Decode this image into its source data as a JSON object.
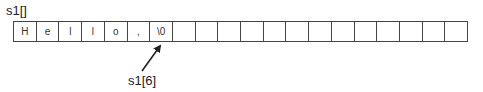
{
  "array": {
    "label": "s1[]",
    "cells": [
      "H",
      "e",
      "l",
      "l",
      "o",
      ",",
      "\\0",
      "",
      "",
      "",
      "",
      "",
      "",
      "",
      "",
      "",
      "",
      "",
      "",
      ""
    ]
  },
  "pointer": {
    "label": "s1[6]",
    "target_index": 6
  }
}
